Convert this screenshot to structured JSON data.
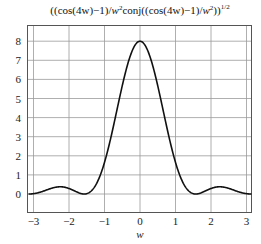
{
  "chart_data": {
    "type": "line",
    "title_parts": {
      "main": "((cos(4w)−1)/",
      "w1": "w",
      "sq1": "2",
      "mid": "conj((cos(4w)−1)/",
      "w2": "w",
      "sq2": "2",
      "end": "))",
      "exp": "1/2"
    },
    "xlabel": "w",
    "ylabel": "",
    "xlim": [
      -3.15,
      3.15
    ],
    "ylim": [
      -0.3,
      8.45
    ],
    "xticks": [
      -3,
      -2,
      -1,
      0,
      1,
      2,
      3
    ],
    "xtick_labels": [
      "−3",
      "−2",
      "−1",
      "0",
      "1",
      "2",
      "3"
    ],
    "yticks": [
      0,
      1,
      2,
      3,
      4,
      5,
      6,
      7,
      8
    ],
    "ytick_labels": [
      "0",
      "1",
      "2",
      "3",
      "4",
      "5",
      "6",
      "7",
      "8"
    ],
    "grid": true,
    "legend": null,
    "series": [
      {
        "name": "|(cos(4w)-1)/w^2|",
        "color": "#111111",
        "x": [
          -3.1,
          -2.8,
          -2.5,
          -2.25,
          -2.0,
          -1.8,
          -1.6,
          -1.5708,
          -1.4,
          -1.2,
          -1.0,
          -0.8,
          -0.6,
          -0.4,
          -0.2,
          0,
          0.2,
          0.4,
          0.6,
          0.8,
          1.0,
          1.2,
          1.4,
          1.5708,
          1.6,
          1.8,
          2.0,
          2.25,
          2.5,
          2.8,
          3.1
        ],
        "y": [
          0.01,
          0.19,
          0.34,
          0.38,
          0.29,
          0.14,
          0.02,
          0.0,
          0.09,
          0.71,
          1.65,
          2.89,
          4.19,
          5.51,
          6.74,
          8.0,
          6.74,
          5.51,
          4.19,
          2.89,
          1.65,
          0.71,
          0.09,
          0.0,
          0.02,
          0.14,
          0.29,
          0.38,
          0.34,
          0.19,
          0.01
        ]
      }
    ]
  }
}
